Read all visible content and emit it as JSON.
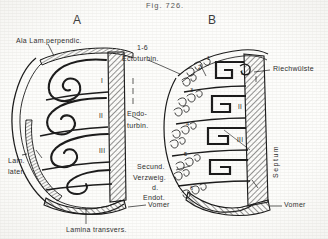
{
  "figure": {
    "caption": "Fig. 726.",
    "panels": [
      {
        "id": "A",
        "letter": "A"
      },
      {
        "id": "B",
        "letter": "B"
      }
    ],
    "colors": {
      "ink": "#1a1a1a",
      "label_ink": "#2b2b2b",
      "caption_ink": "#555555",
      "paper": "#fdfdfb",
      "hatch": "#3a3a3a"
    }
  },
  "labels": {
    "ala_lam_perpendic": "Ala Lam.perpendic.",
    "ectoturbin_range": "1-6",
    "ectoturbin": "Ectoturbin.",
    "endoturbin_line1": "Endo-",
    "endoturbin_line2": "turbin.",
    "secund_line1": "Secund.",
    "secund_line2": "Verzweig.",
    "secund_line3": "d.",
    "secund_line4": "Endot.",
    "lam_later_line1": "Lam.",
    "lam_later_line2": "later.",
    "lamina_transvers": "Lamina transvers.",
    "vomer_left": "Vomer",
    "vomer_right": "Vomer",
    "riechwuelste": "Riechwülste",
    "septum": "Septum"
  },
  "panel_a": {
    "roman_numerals": [
      "I",
      "II",
      "III"
    ],
    "structure_note": "endoturbinal scrolls with hatched septum and lamina transversa"
  },
  "panel_b": {
    "roman_numerals": [
      "I",
      "II",
      "III"
    ],
    "ectoturbinal_numbers": [
      "1",
      "2",
      "3",
      "4",
      "5",
      "6"
    ],
    "structure_note": "secondary branching of endoturbinals with hatched septum"
  }
}
